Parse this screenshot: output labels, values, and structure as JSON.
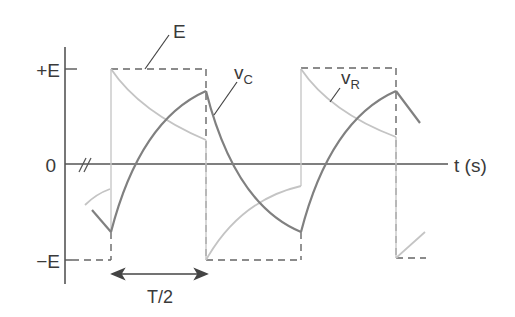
{
  "diagram": {
    "axis": {
      "y_labels": {
        "plus_e": "+E",
        "zero": "0",
        "minus_e": "−E"
      },
      "x_label": "t (s)",
      "break_mark": "//"
    },
    "annotations": {
      "source_label": "E",
      "vc_label_main": "v",
      "vc_label_sub": "C",
      "vr_label_main": "v",
      "vr_label_sub": "R",
      "period_label": "T/2"
    },
    "colors": {
      "axis": "#555555",
      "square_wave": "#666666",
      "vc": "#808080",
      "vr": "#c4c4c4",
      "text": "#3a3a3a"
    }
  }
}
